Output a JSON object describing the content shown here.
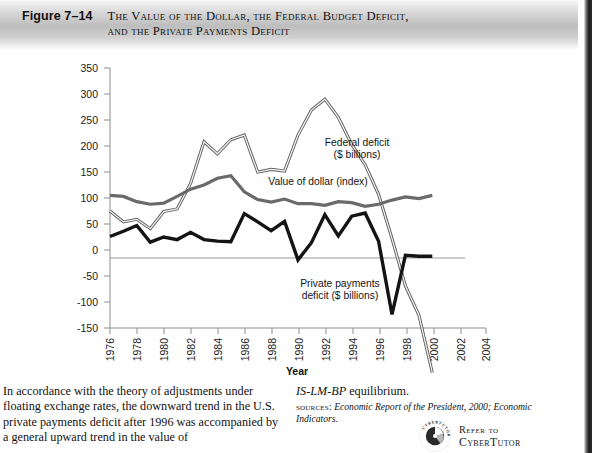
{
  "figure": {
    "number": "Figure 7–14",
    "title": "The Value of the Dollar, the Federal Budget Deficit,\nand the Private Payments Deficit"
  },
  "chart_data": {
    "type": "line",
    "title": "The Value of the Dollar, the Federal Budget Deficit, and the Private Payments Deficit",
    "xlabel": "Year",
    "ylabel": "",
    "xlim": [
      1976,
      2004
    ],
    "ylim": [
      -150,
      350
    ],
    "grid": false,
    "legend_position": "inline-annotations",
    "xticks": [
      "1976",
      "1978",
      "1980",
      "1982",
      "1984",
      "1986",
      "1988",
      "1990",
      "1992",
      "1994",
      "1996",
      "1998",
      "2000",
      "2002",
      "2004"
    ],
    "yticks": [
      "350",
      "300",
      "250",
      "200",
      "150",
      "100",
      "50",
      "0",
      "-50",
      "-100",
      "-150"
    ],
    "x": [
      1976,
      1977,
      1978,
      1979,
      1980,
      1981,
      1982,
      1983,
      1984,
      1985,
      1986,
      1987,
      1988,
      1989,
      1990,
      1991,
      1992,
      1993,
      1994,
      1995,
      1996,
      1997,
      1998,
      1999,
      2000
    ],
    "series": [
      {
        "name": "Federal deficit ($ billions)",
        "annotation": "Federal deficit\n($ billions)",
        "style": "outlined-gray",
        "values": [
          75,
          54,
          59,
          41,
          74,
          79,
          128,
          208,
          185,
          212,
          221,
          150,
          155,
          152,
          221,
          269,
          290,
          255,
          203,
          164,
          107,
          22,
          -69,
          -125,
          -236
        ]
      },
      {
        "name": "Value of dollar (index)",
        "annotation": "Value of dollar (index)",
        "style": "solid-gray",
        "values": [
          105,
          103,
          93,
          88,
          90,
          103,
          117,
          125,
          138,
          143,
          112,
          97,
          92,
          98,
          89,
          89,
          86,
          93,
          91,
          84,
          88,
          96,
          102,
          99,
          105
        ]
      },
      {
        "name": "Private payments deficit ($ billions)",
        "annotation": "Private payments\ndeficit ($ billions)",
        "style": "solid-black",
        "values": [
          26,
          36,
          47,
          15,
          25,
          20,
          34,
          20,
          17,
          16,
          70,
          54,
          37,
          55,
          -19,
          14,
          68,
          27,
          65,
          71,
          17,
          -124,
          -10,
          -12,
          -12
        ]
      }
    ]
  },
  "axis": {
    "x_title": "Year"
  },
  "body": {
    "left_paragraph": "In accordance with the theory of adjustments under floating exchange rates, the downward trend in the U.S. private payments deficit after 1996 was accompanied by a general upward trend in the value of",
    "right_equilibrium_italic": "IS-LM-BP",
    "right_equilibrium_rest": " equilibrium.",
    "sources_label": "sources:",
    "sources_text": "Economic Report of the President, 2000; Economic Indicators."
  },
  "cybertutor": {
    "refer_to": "Refer to",
    "name": "CyberTutor",
    "ring_text": "CYBERTUTOR"
  }
}
